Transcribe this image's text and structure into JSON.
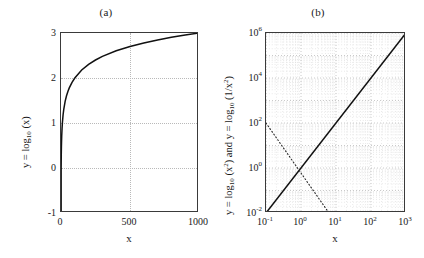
{
  "figure": {
    "caption_a": "(a)",
    "caption_b": "(b)"
  },
  "panel_a": {
    "title": "(a)",
    "xlabel": "x",
    "ylabel_prefix": "y = log",
    "ylabel_sub": "10",
    "ylabel_arg": " (x)",
    "yticks": [
      "-1",
      "0",
      "1",
      "2",
      "3"
    ],
    "xticks": [
      "0",
      "500",
      "1000"
    ]
  },
  "panel_b": {
    "title": "(b)",
    "xlabel": "x",
    "ylabel_full": "y = log10 (x2) and y = log10 (1/x2)",
    "ylabel_p1": "y = log",
    "ylabel_s1": "10",
    "ylabel_a1": " (x",
    "ylabel_e1": "2",
    "ylabel_mid": ") and y = log",
    "ylabel_s2": "10",
    "ylabel_a2": " (1/x",
    "ylabel_e2": "2",
    "ylabel_end": ")",
    "yticks": [
      "10-2",
      "100",
      "102",
      "104",
      "106"
    ],
    "ytick_mant": [
      "10",
      "10",
      "10",
      "10",
      "10"
    ],
    "ytick_exp": [
      "-2",
      "0",
      "2",
      "4",
      "6"
    ],
    "xtick_mant": [
      "10",
      "10",
      "10",
      "10",
      "10"
    ],
    "xtick_exp": [
      "-1",
      "0",
      "1",
      "2",
      "3"
    ]
  },
  "chart_data": [
    {
      "type": "line",
      "panel": "a",
      "title": "(a)",
      "xlabel": "x",
      "ylabel": "y = log10 (x)",
      "xlim": [
        0,
        1000
      ],
      "ylim": [
        -1,
        3
      ],
      "xticks": [
        0,
        500,
        1000
      ],
      "yticks": [
        -1,
        0,
        1,
        2,
        3
      ],
      "xscale": "linear",
      "yscale": "linear",
      "grid": true,
      "grid_style": "dotted",
      "legend": "none",
      "series": [
        {
          "name": "y = log10(x)",
          "style": "solid",
          "x": [
            1,
            2,
            5,
            10,
            20,
            40,
            60,
            80,
            100,
            150,
            200,
            300,
            400,
            500,
            600,
            700,
            800,
            900,
            1000
          ],
          "y": [
            0.0,
            0.301,
            0.699,
            1.0,
            1.301,
            1.602,
            1.778,
            1.903,
            2.0,
            2.176,
            2.301,
            2.477,
            2.602,
            2.699,
            2.778,
            2.845,
            2.903,
            2.954,
            3.0
          ]
        }
      ]
    },
    {
      "type": "line",
      "panel": "b",
      "title": "(b)",
      "xlabel": "x",
      "ylabel": "y = log10 (x2) and y = log10 (1/x2)",
      "xlim": [
        0.1,
        1000
      ],
      "ylim": [
        0.01,
        1000000
      ],
      "xscale": "log",
      "yscale": "log",
      "xticks": [
        0.1,
        1,
        10,
        100,
        1000
      ],
      "yticks": [
        0.01,
        1,
        100,
        10000,
        1000000
      ],
      "grid": true,
      "grid_style": "dotted-minor-log",
      "legend": "none",
      "series": [
        {
          "name": "y = x^2",
          "style": "solid",
          "x": [
            0.1,
            1,
            10,
            100,
            1000
          ],
          "y": [
            0.01,
            1,
            100,
            10000,
            1000000
          ]
        },
        {
          "name": "y = 1/x^2",
          "style": "dotted",
          "x": [
            0.1,
            1,
            10,
            100,
            1000
          ],
          "y": [
            100,
            1,
            0.01,
            0.0001,
            1e-06
          ]
        }
      ]
    }
  ]
}
